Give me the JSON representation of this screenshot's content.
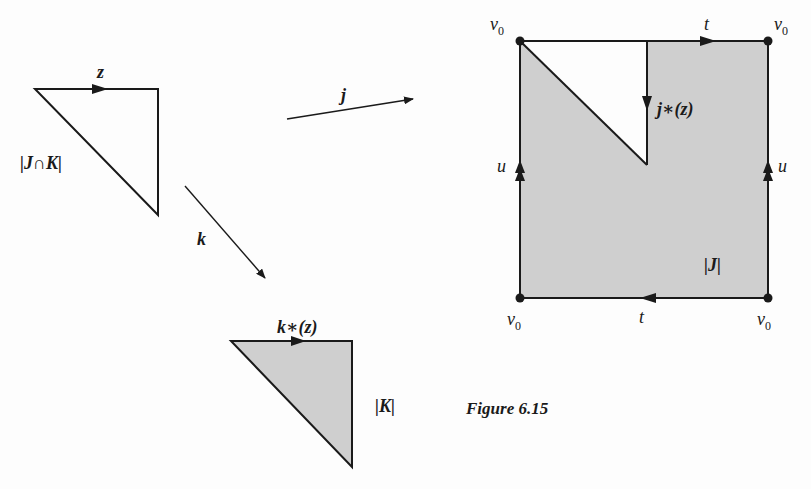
{
  "figure": {
    "caption": "Figure 6.15",
    "colors": {
      "stroke": "#1a1a1a",
      "fill": "#cfcfcf",
      "background": "#fdfdfd"
    }
  },
  "complexes": {
    "intersection": {
      "label": "|J∩K|",
      "edge_label": "z",
      "filled": false
    },
    "j_complex": {
      "label": "|J|",
      "inner_edge_label": "j∗(z)",
      "vertex_labels": [
        "v0",
        "v0",
        "v0",
        "v0"
      ],
      "top_edge_label": "t",
      "bottom_edge_label": "t",
      "left_edge_label": "u",
      "right_edge_label": "u",
      "filled": true
    },
    "k_complex": {
      "label": "|K|",
      "edge_label": "k∗(z)",
      "filled": true
    }
  },
  "maps": {
    "j": {
      "label": "j"
    },
    "k": {
      "label": "k"
    }
  },
  "labels": {
    "v": "v",
    "sub0": "0",
    "t": "t",
    "u": "u",
    "z": "z",
    "j": "j",
    "k": "k",
    "jstar": "j∗(z)",
    "kstar": "k∗(z)",
    "JcapK": "|J∩K|",
    "J": "|J|",
    "K": "|K|"
  }
}
